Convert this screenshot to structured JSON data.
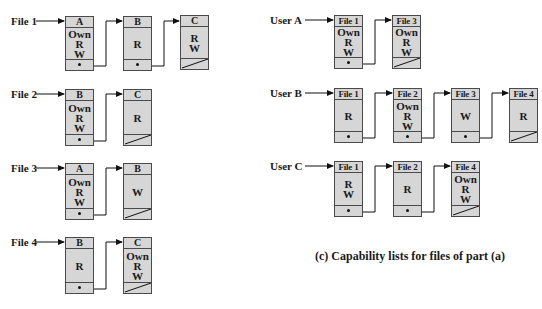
{
  "access_matrix_lists": {
    "title": "Access control lists (per file)",
    "rows": [
      {
        "label": "File 1",
        "entries": [
          {
            "subject": "A",
            "rights": [
              "Own",
              "R",
              "W"
            ]
          },
          {
            "subject": "B",
            "rights": [
              "R"
            ]
          },
          {
            "subject": "C",
            "rights": [
              "R",
              "W"
            ]
          }
        ]
      },
      {
        "label": "File 2",
        "entries": [
          {
            "subject": "B",
            "rights": [
              "Own",
              "R",
              "W"
            ]
          },
          {
            "subject": "C",
            "rights": [
              "R"
            ]
          }
        ]
      },
      {
        "label": "File 3",
        "entries": [
          {
            "subject": "A",
            "rights": [
              "Own",
              "R",
              "W"
            ]
          },
          {
            "subject": "B",
            "rights": [
              "W"
            ]
          }
        ]
      },
      {
        "label": "File 4",
        "entries": [
          {
            "subject": "B",
            "rights": [
              "R"
            ]
          },
          {
            "subject": "C",
            "rights": [
              "Own",
              "R",
              "W"
            ]
          }
        ]
      }
    ]
  },
  "capability_lists": {
    "caption": "(c) Capability lists for files of part (a)",
    "rows": [
      {
        "label": "User A",
        "entries": [
          {
            "object": "File 1",
            "rights": [
              "Own",
              "R",
              "W"
            ]
          },
          {
            "object": "File 3",
            "rights": [
              "Own",
              "R",
              "W"
            ]
          }
        ]
      },
      {
        "label": "User B",
        "entries": [
          {
            "object": "File 1",
            "rights": [
              "R"
            ]
          },
          {
            "object": "File 2",
            "rights": [
              "Own",
              "R",
              "W"
            ]
          },
          {
            "object": "File 3",
            "rights": [
              "W"
            ]
          },
          {
            "object": "File 4",
            "rights": [
              "R"
            ]
          }
        ]
      },
      {
        "label": "User C",
        "entries": [
          {
            "object": "File 1",
            "rights": [
              "R",
              "W"
            ]
          },
          {
            "object": "File 2",
            "rights": [
              "R"
            ]
          },
          {
            "object": "File 4",
            "rights": [
              "Own",
              "R",
              "W"
            ]
          }
        ]
      }
    ]
  },
  "colors": {
    "node_fill": "#d6d6d6",
    "node_border": "#4a4a4a",
    "line": "#111111"
  }
}
